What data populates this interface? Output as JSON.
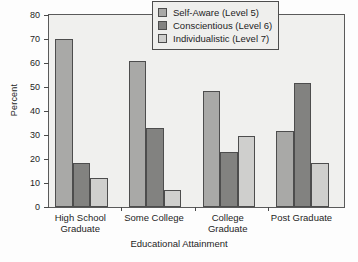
{
  "chart_data": {
    "type": "bar",
    "title": "",
    "xlabel": "Educational Attainment",
    "ylabel": "Percent",
    "ylim": [
      0,
      80
    ],
    "yticks": [
      0,
      10,
      20,
      30,
      40,
      50,
      60,
      70,
      80
    ],
    "grid": false,
    "legend_position": "top-right",
    "categories": [
      "High School Graduate",
      "Some College",
      "College Graduate",
      "Post Graduate"
    ],
    "category_lines": [
      [
        "High School",
        "Graduate"
      ],
      [
        "Some College",
        ""
      ],
      [
        "College",
        "Graduate"
      ],
      [
        "Post Graduate",
        ""
      ]
    ],
    "series": [
      {
        "name": "Self-Aware (Level 5)",
        "color": "#a9a9a7",
        "values": [
          70,
          61,
          48.5,
          31.5
        ]
      },
      {
        "name": "Conscientious (Level 6)",
        "color": "#828280",
        "values": [
          18.5,
          33,
          23,
          51.5
        ]
      },
      {
        "name": "Individualistic (Level 7)",
        "color": "#cfcfcd",
        "values": [
          12,
          7,
          29.5,
          18.5
        ]
      }
    ]
  }
}
